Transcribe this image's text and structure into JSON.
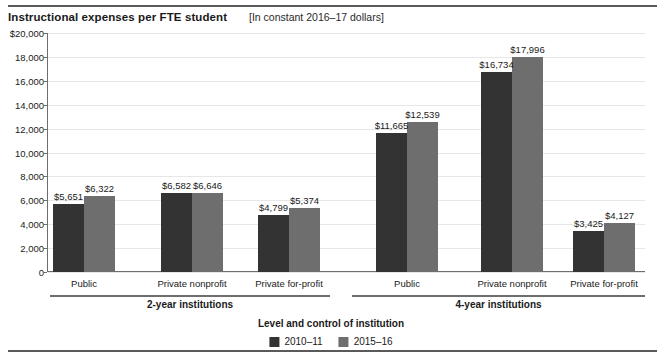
{
  "chart_data": {
    "type": "bar",
    "title": "Instructional expenses per FTE student",
    "subtitle": "[In constant 2016–17 dollars]",
    "xlabel": "Level and control of institution",
    "ylabel": "",
    "ylim": [
      0,
      20000
    ],
    "ytick_step": 2000,
    "ytick_labels": [
      "$20,000",
      "18,000",
      "16,000",
      "14,000",
      "12,000",
      "10,000",
      "8,000",
      "6,000",
      "4,000",
      "2,000",
      "0"
    ],
    "ytick_values": [
      20000,
      18000,
      16000,
      14000,
      12000,
      10000,
      8000,
      6000,
      4000,
      2000,
      0
    ],
    "grid": true,
    "legend_position": "bottom",
    "categories": [
      "Public",
      "Private nonprofit",
      "Private for-profit",
      "Public",
      "Private nonprofit",
      "Private for-profit"
    ],
    "groups": [
      {
        "label": "2-year institutions",
        "categories": [
          "Public",
          "Private nonprofit",
          "Private for-profit"
        ]
      },
      {
        "label": "4-year institutions",
        "categories": [
          "Public",
          "Private nonprofit",
          "Private for-profit"
        ]
      }
    ],
    "series": [
      {
        "name": "2010–11",
        "color": "#333333",
        "values": [
          5651,
          6582,
          4799,
          11665,
          16734,
          3425
        ],
        "value_labels": [
          "$5,651",
          "$6,582",
          "$4,799",
          "$11,665",
          "$16,734",
          "$3,425"
        ]
      },
      {
        "name": "2015–16",
        "color": "#6e6e6e",
        "values": [
          6322,
          6646,
          5374,
          12539,
          17996,
          4127
        ],
        "value_labels": [
          "$6,322",
          "$6,646",
          "$5,374",
          "$12,539",
          "$17,996",
          "$4,127"
        ]
      }
    ],
    "legend": [
      "2010–11",
      "2015–16"
    ]
  }
}
